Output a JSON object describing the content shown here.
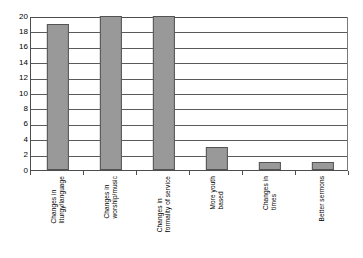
{
  "chart_data": {
    "type": "bar",
    "title": "",
    "subtitle": "",
    "xlabel": "",
    "ylabel": "",
    "ylim": [
      0,
      20
    ],
    "ytick_step": 2,
    "yticks": [
      20,
      18,
      16,
      14,
      12,
      10,
      8,
      6,
      4,
      2,
      0
    ],
    "grid": "horizontal",
    "legend": "none",
    "categories": [
      "Changes in liturgy/language",
      "Changes in worship/music",
      "Changes in formality of service",
      "More youth based",
      "Changes in times",
      "Better sermons"
    ],
    "category_lines": [
      [
        "Changes in",
        "liturgy/language"
      ],
      [
        "Changes in",
        "worship/music"
      ],
      [
        "Changes in",
        "formality of service"
      ],
      [
        "More youth",
        "based"
      ],
      [
        "Changes in",
        "times"
      ],
      [
        "Better sermons"
      ]
    ],
    "values": [
      19,
      20,
      20,
      3,
      1,
      1
    ],
    "bar_color": "#999999",
    "bar_border_color": "#545454",
    "axis_color": "#4d4d4d",
    "grid_color": "#5a5a5a",
    "background_color": "#ffffff"
  }
}
